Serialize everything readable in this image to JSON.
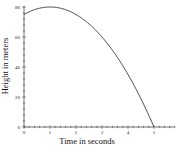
{
  "chart_data": {
    "type": "line",
    "title": "",
    "xlabel": "Time in seconds",
    "ylabel": "Height in meters",
    "xlim": [
      0,
      5.8
    ],
    "ylim": [
      0,
      80
    ],
    "x_ticks": [
      "0",
      "1",
      "2",
      "3",
      "4",
      "5"
    ],
    "y_ticks": [
      "0",
      "20",
      "40",
      "60",
      "80"
    ],
    "grid": false,
    "legend": null,
    "series": [
      {
        "name": "height",
        "equation": "h = -5t^2 + 10t + 75",
        "x": [
          0,
          0.5,
          1,
          1.5,
          2,
          2.5,
          3,
          3.5,
          4,
          4.5,
          5
        ],
        "values": [
          75,
          78.75,
          80,
          78.75,
          75,
          68.75,
          60,
          48.75,
          35,
          18.75,
          0
        ]
      }
    ]
  },
  "colors": {
    "line": "#222222",
    "axis": "#333333"
  }
}
